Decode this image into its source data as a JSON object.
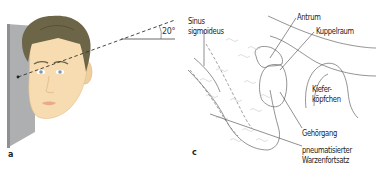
{
  "figure": {
    "panels": [
      {
        "id": "a",
        "letter": "a",
        "description": "Face positioned against a wall with dashed line indicating 20° viewing angle",
        "angle_label": "20°"
      },
      {
        "id": "c",
        "letter": "c",
        "description": "Schematic drawing of temporal bone structures",
        "labels": {
          "sinus": "Sinus",
          "sigmoideus": "sigmoideus",
          "antrum": "Antrum",
          "kuppelraum": "Kuppelraum",
          "kiefer": "Kiefer-",
          "koepfchen": "köpfchen",
          "gehoergang": "Gehörgang",
          "pneumatisierter": "pneumatisierter",
          "warzenfortsatz": "Warzenfortsatz"
        }
      }
    ]
  },
  "colors": {
    "wall": "#a9abad",
    "wall_edge": "#8c8e90",
    "skin": "#f6dcb0",
    "skin_shade": "#ecc897",
    "hair": "#6b6446",
    "hair_dark": "#58523a",
    "eye": "#7f97b5",
    "lips": "#e9a98f",
    "line": "#555555",
    "dashed": "#333333",
    "text": "#222222"
  }
}
